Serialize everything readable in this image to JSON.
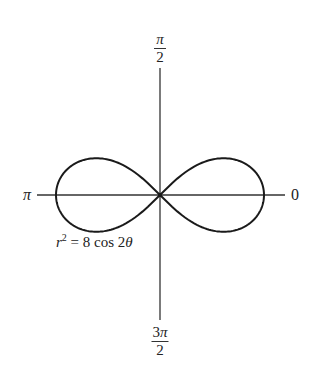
{
  "chart_data": {
    "type": "line",
    "subtype": "polar",
    "title": "",
    "equation": {
      "lhs_var": "r",
      "lhs_exp": "2",
      "rhs": " = 8 cos 2",
      "rhs_var": "θ",
      "full": "r² = 8 cos 2θ"
    },
    "curve": "lemniscate",
    "params": {
      "a_squared": 8,
      "max_r": 2.828
    },
    "axis_labels": {
      "right": "0",
      "top": {
        "num": "π",
        "den": "2"
      },
      "left": "π",
      "bottom": {
        "num_coeff": "3",
        "num_sym": "π",
        "den": "2"
      }
    },
    "intercepts": {
      "x_right": 2.828,
      "x_left": -2.828
    },
    "max_lobe_height": 1.0,
    "grid": false,
    "legend": null
  },
  "style": {
    "curve_color": "#1a1a1a",
    "axis_color": "#333333"
  }
}
